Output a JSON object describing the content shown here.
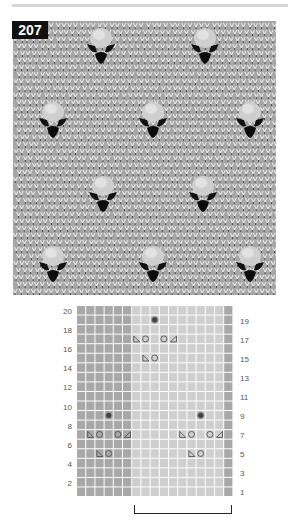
{
  "pattern": {
    "number": "207",
    "photo": {
      "description": "Knitted swatch with bobble and eyelet motifs on stockinette background",
      "bobbles": [
        {
          "x": 101,
          "y": 38
        },
        {
          "x": 205,
          "y": 38
        },
        {
          "x": 53,
          "y": 112
        },
        {
          "x": 153,
          "y": 112
        },
        {
          "x": 250,
          "y": 112
        },
        {
          "x": 103,
          "y": 186
        },
        {
          "x": 203,
          "y": 186
        },
        {
          "x": 53,
          "y": 256
        },
        {
          "x": 153,
          "y": 256
        },
        {
          "x": 250,
          "y": 256
        }
      ]
    },
    "chart": {
      "columns": 17,
      "rows": 20,
      "cell_w": 9.2,
      "cell_h": 9.55,
      "colors": {
        "edge_dark": "#a8a8a8",
        "repeat_light": "#cfcfcf",
        "grid_line": "#eeeeee",
        "symbol": "#555555",
        "bobble": "#444444"
      },
      "edge_columns_left": [
        0,
        1,
        2,
        3,
        4,
        5
      ],
      "repeat_columns": [
        6,
        7,
        8,
        9,
        10,
        11,
        12,
        13,
        14,
        15
      ],
      "edge_columns_right": [
        16
      ],
      "left_row_labels": [
        "20",
        "18",
        "16",
        "14",
        "12",
        "10",
        "8",
        "6",
        "4",
        "2"
      ],
      "right_row_labels": [
        "19",
        "17",
        "15",
        "13",
        "11",
        "9",
        "7",
        "5",
        "3",
        "1"
      ],
      "symbols": [
        {
          "row": 19,
          "col": 8,
          "type": "bobble"
        },
        {
          "row": 17,
          "col": 6,
          "type": "ssk"
        },
        {
          "row": 17,
          "col": 7,
          "type": "yo"
        },
        {
          "row": 17,
          "col": 9,
          "type": "yo"
        },
        {
          "row": 17,
          "col": 10,
          "type": "k2tog"
        },
        {
          "row": 15,
          "col": 7,
          "type": "ssk"
        },
        {
          "row": 15,
          "col": 8,
          "type": "yo"
        },
        {
          "row": 9,
          "col": 3,
          "type": "bobble"
        },
        {
          "row": 9,
          "col": 13,
          "type": "bobble"
        },
        {
          "row": 7,
          "col": 1,
          "type": "ssk"
        },
        {
          "row": 7,
          "col": 2,
          "type": "yo"
        },
        {
          "row": 7,
          "col": 4,
          "type": "yo"
        },
        {
          "row": 7,
          "col": 5,
          "type": "k2tog"
        },
        {
          "row": 7,
          "col": 11,
          "type": "ssk"
        },
        {
          "row": 7,
          "col": 12,
          "type": "yo"
        },
        {
          "row": 7,
          "col": 14,
          "type": "yo"
        },
        {
          "row": 7,
          "col": 15,
          "type": "k2tog"
        },
        {
          "row": 5,
          "col": 2,
          "type": "ssk"
        },
        {
          "row": 5,
          "col": 3,
          "type": "yo"
        },
        {
          "row": 5,
          "col": 12,
          "type": "ssk"
        },
        {
          "row": 5,
          "col": 13,
          "type": "yo"
        }
      ],
      "repeat_bracket": {
        "from_col": 6,
        "to_col": 15,
        "label": ""
      }
    }
  }
}
